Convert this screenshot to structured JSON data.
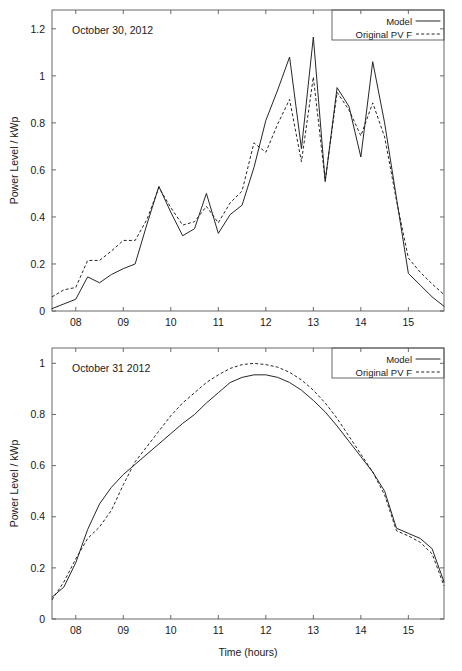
{
  "figure": {
    "background": "#ffffff",
    "ink_color": "#1a1a1a",
    "axis_color": "#585858"
  },
  "axis_titles": {
    "y": "Power Level / kWp",
    "x": "Time (hours)"
  },
  "legend": {
    "model_label": "Model",
    "original_label": "Original PV F"
  },
  "chart_data": [
    {
      "type": "line",
      "title": "October 30, 2012",
      "xlabel": "",
      "ylabel": "Power Level / kWp",
      "xlim": [
        7.5,
        15.75
      ],
      "ylim": [
        0,
        1.28
      ],
      "xticks": [
        8,
        9,
        10,
        11,
        12,
        13,
        14,
        15
      ],
      "xticklabels": [
        "08",
        "09",
        "10",
        "11",
        "12",
        "13",
        "14",
        "15"
      ],
      "yticks": [
        0,
        0.2,
        0.4,
        0.6,
        0.8,
        1,
        1.2
      ],
      "yticklabels": [
        "0",
        "0.2",
        "0.4",
        "0.6",
        "0.8",
        "1",
        "1.2"
      ],
      "grid": false,
      "legend_position": "top-right",
      "series": [
        {
          "name": "Model",
          "style": "solid",
          "x": [
            7.5,
            7.75,
            8.0,
            8.25,
            8.5,
            8.75,
            9.0,
            9.25,
            9.5,
            9.75,
            10.0,
            10.25,
            10.5,
            10.75,
            11.0,
            11.25,
            11.5,
            11.75,
            12.0,
            12.25,
            12.5,
            12.75,
            13.0,
            13.25,
            13.5,
            13.75,
            14.0,
            14.25,
            14.5,
            14.75,
            15.0,
            15.25,
            15.5,
            15.75
          ],
          "values": [
            0.01,
            0.03,
            0.05,
            0.145,
            0.12,
            0.155,
            0.18,
            0.2,
            0.37,
            0.53,
            0.42,
            0.32,
            0.35,
            0.5,
            0.33,
            0.41,
            0.45,
            0.61,
            0.81,
            0.94,
            1.08,
            0.69,
            1.165,
            0.55,
            0.95,
            0.87,
            0.655,
            1.06,
            0.8,
            0.48,
            0.16,
            0.11,
            0.06,
            0.02
          ]
        },
        {
          "name": "Original PV F",
          "style": "dashed",
          "x": [
            7.5,
            7.75,
            8.0,
            8.25,
            8.5,
            8.75,
            9.0,
            9.25,
            9.5,
            9.75,
            10.0,
            10.25,
            10.5,
            10.75,
            11.0,
            11.25,
            11.5,
            11.75,
            12.0,
            12.25,
            12.5,
            12.75,
            13.0,
            13.25,
            13.5,
            13.75,
            14.0,
            14.25,
            14.5,
            14.75,
            15.0,
            15.25,
            15.5,
            15.75
          ],
          "values": [
            0.06,
            0.09,
            0.1,
            0.215,
            0.215,
            0.255,
            0.3,
            0.3,
            0.39,
            0.525,
            0.44,
            0.365,
            0.38,
            0.445,
            0.375,
            0.46,
            0.51,
            0.715,
            0.675,
            0.795,
            0.9,
            0.635,
            0.995,
            0.555,
            0.93,
            0.855,
            0.745,
            0.885,
            0.74,
            0.47,
            0.225,
            0.165,
            0.115,
            0.07
          ]
        }
      ]
    },
    {
      "type": "line",
      "title": "October 31 2012",
      "xlabel": "Time (hours)",
      "ylabel": "Power Level / kWp",
      "xlim": [
        7.5,
        15.75
      ],
      "ylim": [
        0,
        1.06
      ],
      "xticks": [
        8,
        9,
        10,
        11,
        12,
        13,
        14,
        15
      ],
      "xticklabels": [
        "08",
        "09",
        "10",
        "11",
        "12",
        "13",
        "14",
        "15"
      ],
      "yticks": [
        0,
        0.2,
        0.4,
        0.6,
        0.8,
        1
      ],
      "yticklabels": [
        "0",
        "0.2",
        "0.4",
        "0.6",
        "0.8",
        "1"
      ],
      "grid": false,
      "legend_position": "top-right",
      "series": [
        {
          "name": "Model",
          "style": "solid",
          "x": [
            7.5,
            7.75,
            8.0,
            8.25,
            8.5,
            8.75,
            9.0,
            9.25,
            9.5,
            9.75,
            10.0,
            10.25,
            10.5,
            10.75,
            11.0,
            11.25,
            11.5,
            11.75,
            12.0,
            12.25,
            12.5,
            12.75,
            13.0,
            13.25,
            13.5,
            13.75,
            14.0,
            14.25,
            14.5,
            14.75,
            15.0,
            15.25,
            15.5,
            15.75
          ],
          "values": [
            0.085,
            0.125,
            0.22,
            0.35,
            0.45,
            0.515,
            0.565,
            0.605,
            0.645,
            0.685,
            0.725,
            0.765,
            0.8,
            0.845,
            0.885,
            0.925,
            0.945,
            0.955,
            0.955,
            0.945,
            0.925,
            0.895,
            0.855,
            0.81,
            0.755,
            0.695,
            0.635,
            0.575,
            0.5,
            0.355,
            0.335,
            0.315,
            0.275,
            0.145
          ]
        },
        {
          "name": "Original PV F",
          "style": "dashed",
          "x": [
            7.5,
            7.75,
            8.0,
            8.25,
            8.5,
            8.75,
            9.0,
            9.25,
            9.5,
            9.75,
            10.0,
            10.25,
            10.5,
            10.75,
            11.0,
            11.25,
            11.5,
            11.75,
            12.0,
            12.25,
            12.5,
            12.75,
            13.0,
            13.25,
            13.5,
            13.75,
            14.0,
            14.25,
            14.5,
            14.75,
            15.0,
            15.25,
            15.5,
            15.75
          ],
          "values": [
            0.075,
            0.145,
            0.235,
            0.315,
            0.36,
            0.425,
            0.525,
            0.615,
            0.675,
            0.735,
            0.795,
            0.845,
            0.885,
            0.925,
            0.955,
            0.98,
            0.995,
            1.0,
            0.995,
            0.985,
            0.965,
            0.935,
            0.895,
            0.845,
            0.785,
            0.715,
            0.645,
            0.575,
            0.485,
            0.345,
            0.325,
            0.3,
            0.255,
            0.13
          ]
        }
      ]
    }
  ]
}
